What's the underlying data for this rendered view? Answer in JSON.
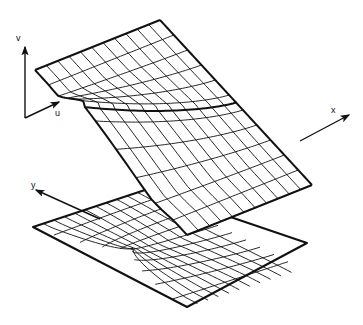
{
  "figure": {
    "background_color": "#ffffff",
    "ink_color": "#111111",
    "width": 363,
    "height": 325
  },
  "axes": {
    "source_frame": {
      "name": "uv-frame",
      "origin": [
        25,
        118
      ],
      "v_axis": {
        "label": "v",
        "label_pos": [
          16,
          41
        ],
        "tip": [
          25,
          47
        ],
        "tail": [
          25,
          118
        ]
      },
      "u_axis": {
        "label": "u",
        "label_pos": [
          55,
          116
        ],
        "tip": [
          59,
          102
        ],
        "tail": [
          25,
          118
        ]
      }
    },
    "target_frame": {
      "name": "xy-frame",
      "x_axis": {
        "label": "x",
        "label_pos": [
          331,
          113
        ],
        "tip": [
          349,
          115
        ],
        "tail": [
          300,
          141
        ]
      },
      "y_axis": {
        "label": "y",
        "label_pos": [
          31,
          188
        ],
        "tip": [
          36,
          190
        ],
        "tail": [
          100,
          219
        ]
      }
    }
  },
  "surface": {
    "name": "fold-surface",
    "description": "Pleated (cusp) surface with u-curves and v-curves",
    "u_curve_count": 11,
    "v_curve_count": 11,
    "outline_vertices": [
      [
        35,
        70
      ],
      [
        160,
        20
      ],
      [
        300,
        141
      ],
      [
        187,
        235
      ]
    ],
    "fold_curve_label": "fold-crease",
    "cusp_point": [
      150,
      131
    ]
  },
  "plane": {
    "name": "image-plane",
    "description": "Horizontal xy-plane carrying the projected grid and cusp caustic",
    "corners": [
      [
        33,
        227
      ],
      [
        148,
        189
      ],
      [
        307,
        243
      ],
      [
        187,
        307
      ]
    ],
    "caustic_focus": [
      137,
      245
    ],
    "projected_u_lines": 11,
    "projected_v_lines": 11
  },
  "stroke_widths": {
    "outline": 2.0,
    "grid": 0.9,
    "axis": 1.4
  }
}
